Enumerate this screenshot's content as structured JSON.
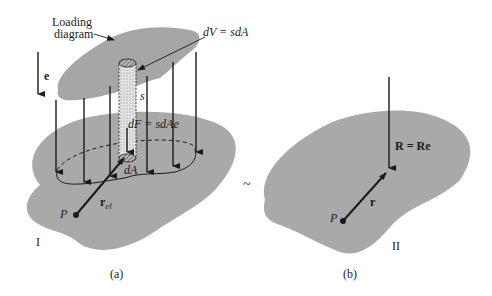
{
  "figure": {
    "panel_a": {
      "caption": "(a)",
      "body_label": "I",
      "loading_label_line1": "Loading",
      "loading_label_line2": "diagram",
      "volume_label": "dV = sdA",
      "height_label": "s",
      "force_label": "dF = sdAe",
      "area_label": "dA",
      "direction_label": "e",
      "position_vector_label": "r",
      "position_vector_subscript": "el",
      "point_label": "P"
    },
    "equivalence_symbol": "~",
    "panel_b": {
      "caption": "(b)",
      "body_label": "II",
      "resultant_label": "R = Re",
      "position_vector_label": "r",
      "point_label": "P"
    },
    "colors": {
      "body_fill": "#a9a9a9",
      "loading_fill": "#a6a6a6",
      "ink": "#1a1a1a",
      "background": "#ffffff"
    }
  }
}
